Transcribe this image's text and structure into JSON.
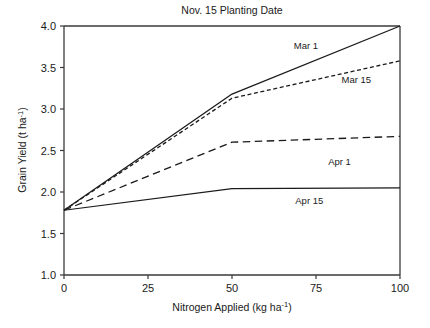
{
  "chart_data": {
    "type": "line",
    "title": "Nov. 15 Planting Date",
    "xlabel_main": "Nitrogen Applied (kg ha",
    "xlabel_sup": "-1",
    "xlabel_tail": ")",
    "ylabel_main": "Grain Yield (t ha",
    "ylabel_sup": "-1",
    "ylabel_tail": ")",
    "xlim": [
      0,
      100
    ],
    "ylim": [
      1.0,
      4.0
    ],
    "xticks": [
      0,
      25,
      50,
      75,
      100
    ],
    "xtick_labels": [
      "0",
      "25",
      "50",
      "75",
      "100"
    ],
    "yticks": [
      1.0,
      1.5,
      2.0,
      2.5,
      3.0,
      3.5,
      4.0
    ],
    "ytick_labels": [
      "1.0",
      "1.5",
      "2.0",
      "2.5",
      "3.0",
      "3.5",
      "4.0"
    ],
    "grid": false,
    "legend_position": "inline-annotations",
    "x": [
      0,
      50,
      100
    ],
    "series": [
      {
        "name": "Mar 1",
        "values": [
          1.78,
          3.18,
          4.0
        ],
        "style": "solid",
        "stroke_width": 1.3,
        "label_x": 72,
        "label_y": 3.72
      },
      {
        "name": "Mar 15",
        "values": [
          1.78,
          3.13,
          3.58
        ],
        "style": "fine-dash",
        "stroke_width": 1.3,
        "label_x": 87,
        "label_y": 3.31
      },
      {
        "name": "Apr 1",
        "values": [
          1.78,
          2.6,
          2.67
        ],
        "style": "long-dash",
        "stroke_width": 1.3,
        "label_x": 82,
        "label_y": 2.33
      },
      {
        "name": "Apr 15",
        "values": [
          1.78,
          2.04,
          2.05
        ],
        "style": "solid",
        "stroke_width": 1.2,
        "label_x": 73,
        "label_y": 1.85
      }
    ]
  }
}
